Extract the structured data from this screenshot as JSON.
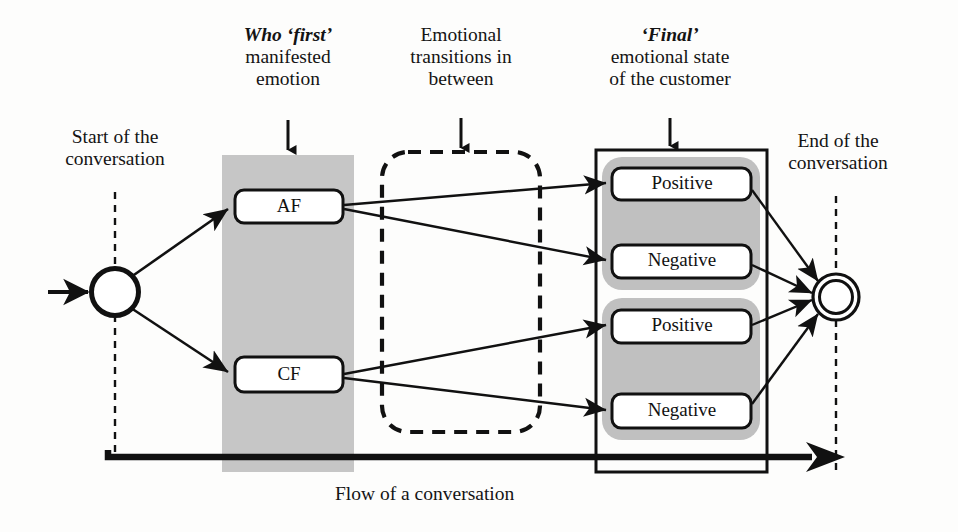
{
  "figure": {
    "caption": "Flow of a conversation",
    "background": "#fdfdfc",
    "ink": "#111111",
    "band_gray": "#c6c6c6",
    "group_gray": "#c0c0c0"
  },
  "annotations": {
    "start": {
      "line1": "Start of the",
      "line2": "conversation"
    },
    "end": {
      "line1": "End of the",
      "line2": "conversation"
    },
    "col_first": {
      "emphasis": "Who ‘first’",
      "line2": "manifested",
      "line3": "emotion"
    },
    "col_transitions": {
      "line1": "Emotional",
      "line2": "transitions in",
      "line3": "between"
    },
    "col_final": {
      "emphasis": "‘Final’",
      "line2": "emotional state",
      "line3": "of the customer"
    }
  },
  "nodes": {
    "start_node": {
      "label": "",
      "shape": "circle"
    },
    "end_node": {
      "label": "",
      "shape": "double-circle"
    },
    "first_emotion": [
      {
        "id": "af",
        "label": "AF"
      },
      {
        "id": "cf",
        "label": "CF"
      }
    ],
    "final_states": [
      {
        "id": "af-positive",
        "label": "Positive",
        "group": "af"
      },
      {
        "id": "af-negative",
        "label": "Negative",
        "group": "af"
      },
      {
        "id": "cf-positive",
        "label": "Positive",
        "group": "cf"
      },
      {
        "id": "cf-negative",
        "label": "Negative",
        "group": "cf"
      }
    ]
  },
  "regions": {
    "first_emotion_band": "shaded column",
    "transitions_region": "dashed rounded rectangle",
    "final_state_box": "solid rectangle"
  }
}
